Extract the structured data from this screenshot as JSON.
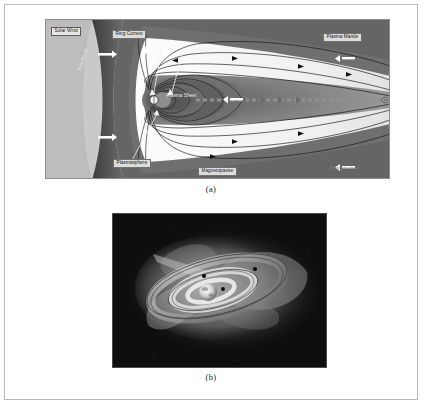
{
  "figure": {
    "panel_a": {
      "caption": "(a)",
      "labels": {
        "solar_wind": "Solar Wind",
        "bow_shock": "Bow Shock",
        "ring_current": "Ring Current",
        "tail_lobe": "Tail Lobe",
        "plasma_mantle": "Plasma Mantle",
        "plasma_sheet": "Plasma Sheet",
        "plasmasphere": "Plasmasphere",
        "magnetopause": "Magnetopause",
        "magnetosheath": "Magnetosheath"
      },
      "colors": {
        "background": "#cfcfcf",
        "magnetosheath": "#4a4a4a",
        "lobe": "#f2f2f2",
        "plasma_sheet": "#8d8d8d",
        "inner_belt": "#6e6e6e",
        "field_line": "#1a1a1a",
        "neutral_sheet": "#909090"
      }
    },
    "panel_b": {
      "caption": "(b)",
      "colors": {
        "background": "#0d0d0d",
        "torus_outer": "#9a9a9a",
        "torus_inner": "#d8d8d8",
        "lobe_glow": "#bdbdbd",
        "earth": "#e6e6e6",
        "satellite": "#111111"
      }
    }
  }
}
